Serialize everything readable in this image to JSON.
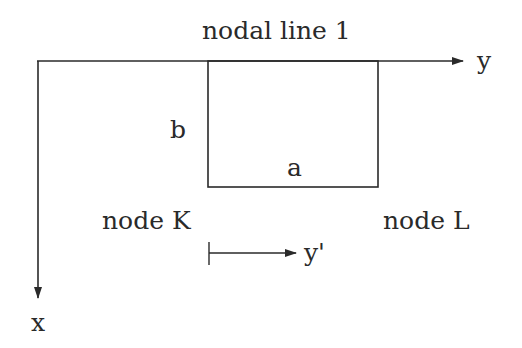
{
  "diagram": {
    "title_label": "nodal line 1",
    "axis_y_label": "y",
    "axis_x_label": "x",
    "side_b_label": "b",
    "side_a_label": "a",
    "node_k_label": "node K",
    "node_l_label": "node L",
    "local_axis_label": "y'",
    "colors": {
      "stroke": "#2a2a2a",
      "background": "#ffffff"
    }
  }
}
